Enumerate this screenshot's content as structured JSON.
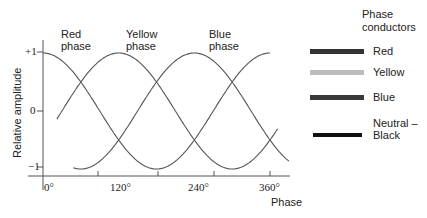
{
  "chart_data": {
    "type": "line",
    "title": "",
    "xlabel": "Phase",
    "ylabel": "Relative amplitude",
    "x_unit": "degrees",
    "xlim": [
      0,
      390
    ],
    "ylim": [
      -1,
      1
    ],
    "x_ticks": [
      "0°",
      "120°",
      "240°",
      "360°"
    ],
    "y_ticks": [
      "+1",
      "0",
      "−1"
    ],
    "grid": false,
    "legend_position": "right",
    "series": [
      {
        "name": "Red phase",
        "function": "cos(θ)",
        "x_start": 0,
        "x_end": 360,
        "annotation": "Red\nphase"
      },
      {
        "name": "Yellow phase",
        "function": "cos(θ − 120°)",
        "x_start": 22,
        "x_end": 372,
        "annotation": "Yellow\nphase"
      },
      {
        "name": "Blue phase",
        "function": "cos(θ − 240°)",
        "x_start": 48,
        "x_end": 390,
        "annotation": "Blue\nphase"
      }
    ],
    "legend": {
      "title": "Phase\nconductors",
      "entries": [
        {
          "label": "Red",
          "color": "#333333"
        },
        {
          "label": "Yellow",
          "color": "#bdbdbd"
        },
        {
          "label": "Blue",
          "color": "#3a3a3a"
        },
        {
          "label": "Neutral –\nBlack",
          "color": "#111111"
        }
      ]
    }
  }
}
